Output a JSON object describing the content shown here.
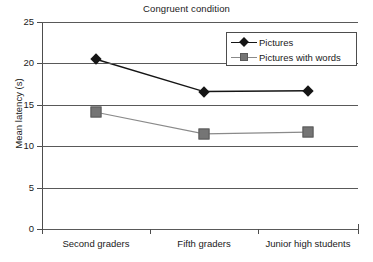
{
  "chart_data": {
    "type": "line",
    "title": "Congruent condition",
    "xlabel": "",
    "ylabel": "Mean latency (s)",
    "categories": [
      "Second graders",
      "Fifth graders",
      "Junior high students"
    ],
    "ylim": [
      0,
      25
    ],
    "yticks": [
      0,
      5,
      10,
      15,
      20,
      25
    ],
    "ytick_labels": [
      "0",
      "5",
      "10",
      "15",
      "20",
      "25"
    ],
    "grid": "horizontal",
    "legend_position": "top-right",
    "series": [
      {
        "name": "Pictures",
        "marker": "diamond",
        "color": "#151515",
        "values": [
          20.5,
          16.6,
          16.7
        ]
      },
      {
        "name": "Pictures with words",
        "marker": "square",
        "color": "#757575",
        "values": [
          14.1,
          11.5,
          11.7
        ]
      }
    ]
  },
  "colors": {
    "series_1": "#151515",
    "series_2": "#757575",
    "axis": "#4d4d4d",
    "grid": "#595959",
    "background": "#ffffff"
  }
}
